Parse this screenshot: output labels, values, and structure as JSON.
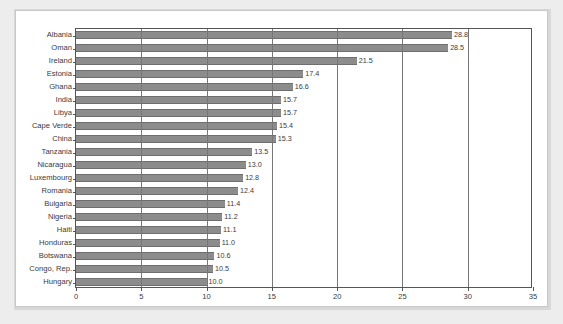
{
  "chart_data": {
    "type": "bar",
    "orientation": "horizontal",
    "title": "",
    "subtitle": "",
    "xlabel": "",
    "ylabel": "",
    "xlim": [
      0,
      35
    ],
    "xticks": [
      0,
      5,
      10,
      15,
      20,
      25,
      30,
      35
    ],
    "xtick_labels": [
      "0",
      "5",
      "10",
      "15",
      "20",
      "25",
      "30",
      "35"
    ],
    "grid": "vertical",
    "legend": "none",
    "categories": [
      "Albania",
      "Oman",
      "Ireland",
      "Estonia",
      "Ghana",
      "India",
      "Libya",
      "Cape Verde",
      "China",
      "Tanzania",
      "Nicaragua",
      "Luxembourg",
      "Romania",
      "Bulgaria",
      "Nigeria",
      "Haiti",
      "Honduras",
      "Botswana",
      "Congo, Rep.",
      "Hungary"
    ],
    "values": [
      28.8,
      28.5,
      21.5,
      17.4,
      16.6,
      15.7,
      15.7,
      15.4,
      15.3,
      13.5,
      13.0,
      12.8,
      12.4,
      11.4,
      11.2,
      11.1,
      11.0,
      10.6,
      10.5,
      10.0
    ],
    "value_labels": [
      "28.8",
      "28.5",
      "21.5",
      "17.4",
      "16.6",
      "15.7",
      "15.7",
      "15.4",
      "15.3",
      "13.5",
      "13.0",
      "12.8",
      "12.4",
      "11.4",
      "11.2",
      "11.1",
      "11.0",
      "10.6",
      "10.5",
      "10.0"
    ],
    "colors": {
      "bar_fill": "#8c8c8c",
      "bar_edge": "#6e6e6e",
      "gridline": "#777777",
      "axis": "#555555",
      "text": "#3a3a3a",
      "panel_background": "#ffffff",
      "page_background": "#ededed"
    }
  }
}
